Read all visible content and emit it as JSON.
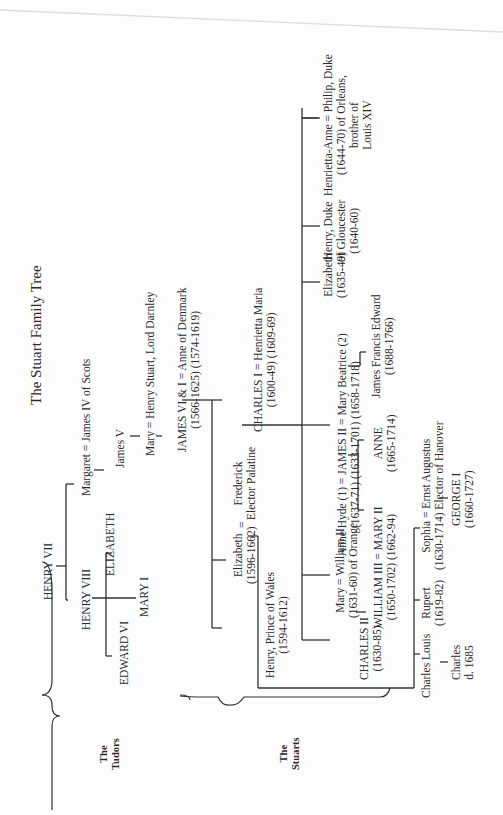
{
  "title": "The Stuart Family Tree",
  "groups": {
    "tudors": [
      "The",
      "Tudors"
    ],
    "stuarts": [
      "The",
      "Stuarts"
    ]
  },
  "people": {
    "henry7": [
      "HENRY VII"
    ],
    "henry8": [
      "HENRY VIII"
    ],
    "elizabeth1": [
      "ELIZABETH"
    ],
    "mary1": [
      "MARY I"
    ],
    "edward6": [
      "EDWARD VI"
    ],
    "margaret": [
      "Margaret = James IV of Scots"
    ],
    "james5": [
      "James V"
    ],
    "mary_qs": [
      "Mary = Henry Stuart, Lord Darnley"
    ],
    "james6": [
      "JAMES VI & I = Anne of Denmark",
      "(1566-1625)        (1574-1619)"
    ],
    "charles1": [
      "CHARLES I = Henrietta Maria",
      "(1600-49)           (1609-69)"
    ],
    "elizabeth_b": [
      "Elizabeth",
      "(1596-1662)"
    ],
    "eq1": [
      "="
    ],
    "frederick": [
      "Frederick",
      "Elector Palatine"
    ],
    "henry_pw": [
      "Henry, Prince of Wales",
      "(1594-1612)"
    ],
    "mary_o": [
      "Mary = William II",
      "(1631-60)    of Orange"
    ],
    "charles2": [
      "CHARLES II",
      "(1630-85)"
    ],
    "william3": [
      "WILLIAM III = MARY II",
      "(1650-1702)     (1662-94)"
    ],
    "james2": [
      "Anne Hyde (1) = JAMES II = Mary Beatrice (2)",
      "(1637-71)          (1633-1701)      (1658-1718)"
    ],
    "anne": [
      "ANNE",
      "(1665-1714)"
    ],
    "jfe": [
      "James Francis Edward",
      "(1688-1766)"
    ],
    "elizabeth_c": [
      "Elizabeth",
      "(1635-49)"
    ],
    "henry_g": [
      "Henry, Duke",
      "of Gloucester",
      "(1640-60)"
    ],
    "henrietta": [
      "Henrietta-Anne = Philip, Duke",
      "(1644-70)            of Orleans,",
      "brother of",
      "Louis XIV"
    ],
    "charles_louis": [
      "Charles Louis"
    ],
    "charles_d": [
      "Charles",
      "d. 1685"
    ],
    "rupert": [
      "Rupert",
      "(1619-82)"
    ],
    "sophia": [
      "Sophia   =   Ernst Augustus",
      "(1630-1714)   Elector of Hanover"
    ],
    "george1": [
      "GEORGE I",
      "(1660-1727)"
    ]
  }
}
